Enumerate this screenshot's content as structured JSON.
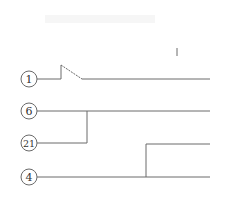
{
  "diagram": {
    "type": "line-merge diagram",
    "nodes": [
      {
        "id": "1",
        "label": "1",
        "cx": 29,
        "cy": 79
      },
      {
        "id": "6",
        "label": "6",
        "cx": 29,
        "cy": 111
      },
      {
        "id": "21",
        "label": "21",
        "cx": 29,
        "cy": 143
      },
      {
        "id": "4",
        "label": "4",
        "cx": 29,
        "cy": 177
      }
    ],
    "connections": [
      {
        "from": "1",
        "type": "switch-open",
        "note": "line with open switch contact"
      },
      {
        "from": "6",
        "type": "straight"
      },
      {
        "from": "21",
        "type": "joins",
        "to": "6"
      },
      {
        "from": "4",
        "type": "branches",
        "note": "splits into two outgoing lines"
      }
    ],
    "colors": {
      "line": "#6a6a6a",
      "text": "#333333",
      "background": "#ffffff"
    }
  }
}
